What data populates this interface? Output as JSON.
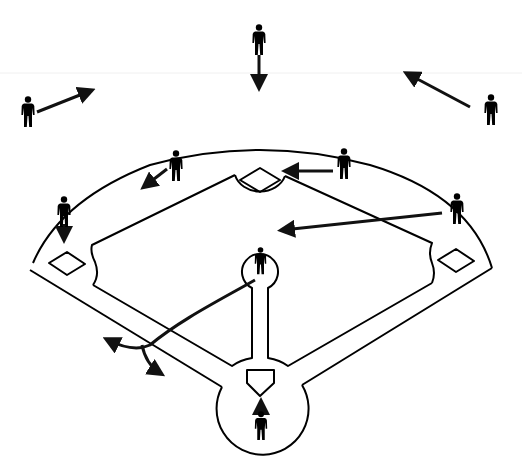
{
  "diagram": {
    "title": "",
    "type": "baseball defensive positioning diagram",
    "colors": {
      "line": "#000000",
      "background": "#ffffff",
      "player": "#000000"
    },
    "players": [
      {
        "id": "center-fielder",
        "x": 259,
        "y": 40,
        "arrow": {
          "x1": 259,
          "y1": 55,
          "x2": 259,
          "y2": 88
        }
      },
      {
        "id": "left-fielder",
        "x": 28,
        "y": 112,
        "arrow": {
          "x1": 37,
          "y1": 112,
          "x2": 92,
          "y2": 90
        }
      },
      {
        "id": "right-fielder",
        "x": 491,
        "y": 110,
        "arrow": {
          "x1": 470,
          "y1": 107,
          "x2": 406,
          "y2": 73
        }
      },
      {
        "id": "shortstop",
        "x": 176,
        "y": 166,
        "arrow": {
          "x1": 167,
          "y1": 169,
          "x2": 143,
          "y2": 187
        }
      },
      {
        "id": "second-baseman",
        "x": 344,
        "y": 164,
        "arrow": {
          "x1": 335,
          "y1": 171,
          "x2": 285,
          "y2": 171
        }
      },
      {
        "id": "third-baseman",
        "x": 64,
        "y": 212,
        "arrow": {
          "x1": 64,
          "y1": 222,
          "x2": 64,
          "y2": 240
        }
      },
      {
        "id": "first-baseman",
        "x": 457,
        "y": 209,
        "arrow": {
          "x1": 442,
          "y1": 213,
          "x2": 281,
          "y2": 230
        }
      },
      {
        "id": "pitcher",
        "x": 261,
        "y": 262,
        "arrow": null
      },
      {
        "id": "catcher",
        "x": 261,
        "y": 427,
        "arrow": {
          "x1": 261,
          "y1": 410,
          "x2": 261,
          "y2": 402
        }
      }
    ],
    "bases": [
      {
        "id": "second-base",
        "x": 260,
        "y": 180
      },
      {
        "id": "third-base",
        "x": 67,
        "y": 264
      },
      {
        "id": "first-base",
        "x": 456,
        "y": 261
      },
      {
        "id": "home-plate",
        "x": 260,
        "y": 378
      }
    ],
    "ball_path": {
      "description": "batted ball to left side, deflected",
      "path": "M255 280 C 220 300, 180 320, 150 345 C 135 352, 118 345, 106 340",
      "branch": "M142 345 C 145 360, 152 368, 162 374"
    }
  }
}
